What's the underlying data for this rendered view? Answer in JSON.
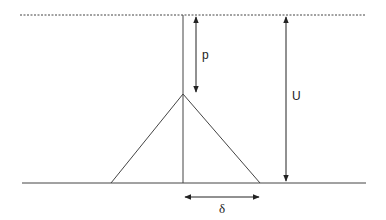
{
  "diagram": {
    "colors": {
      "line": "#333333",
      "background": "#ffffff"
    },
    "elements": {
      "reference_line": {
        "style": "dashed"
      },
      "ground_line": {
        "style": "solid"
      },
      "center_line": {
        "style": "solid"
      },
      "triangle": {
        "style": "solid"
      }
    },
    "labels": {
      "p": "p",
      "U": "U",
      "delta": "δ"
    }
  }
}
